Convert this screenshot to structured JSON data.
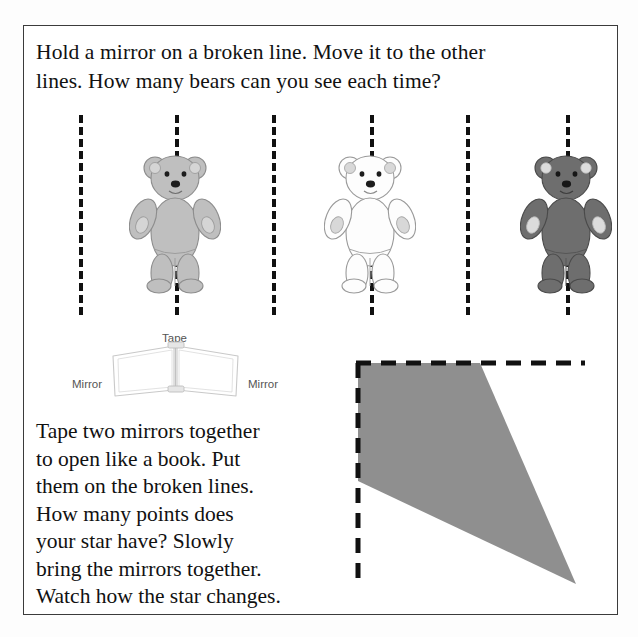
{
  "page": {
    "kind": "worksheet-page",
    "background_color": "#ffffff",
    "frame_color": "#3b3b3b"
  },
  "heading": {
    "lines": [
      "Hold a mirror on a broken line. Move it to the other",
      "lines. How many bears can you see each time?"
    ]
  },
  "bears_activity": {
    "broken_lines": [
      {
        "name": "broken-line-1",
        "x": 56
      },
      {
        "name": "broken-line-2",
        "x": 152
      },
      {
        "name": "broken-line-3",
        "x": 249
      },
      {
        "name": "broken-line-4",
        "x": 347
      },
      {
        "name": "broken-line-5",
        "x": 443
      },
      {
        "name": "broken-line-6",
        "x": 543
      }
    ],
    "line_style": "dashed",
    "line_color": "#111111",
    "bears": [
      {
        "name": "bear-gray",
        "center_x": 152,
        "body_color": "#bfbfbf",
        "outline_color": "#8d8d8d",
        "pad_color": "#d5d5d5",
        "label": "light gray bear"
      },
      {
        "name": "bear-white",
        "center_x": 347,
        "body_color": "#fdfdfd",
        "outline_color": "#9a9a9a",
        "pad_color": "#d8d8d8",
        "label": "white bear"
      },
      {
        "name": "bear-dark",
        "center_x": 543,
        "body_color": "#6e6e6e",
        "outline_color": "#4a4a4a",
        "pad_color": "#dcdcdc",
        "label": "dark gray bear"
      }
    ]
  },
  "mirror_diagram": {
    "tape_label": "Tape",
    "mirror_label_left": "Mirror",
    "mirror_label_right": "Mirror",
    "label_color": "#555555",
    "panel_outline_color": "#c9c9c9"
  },
  "body_text": {
    "lines": [
      "Tape two mirrors together",
      "to open like a book. Put",
      "them on the broken lines.",
      "How many points does",
      "your star have? Slowly",
      "bring the mirrors together.",
      "Watch how the star changes."
    ]
  },
  "star_figure": {
    "name": "quarter-star-wedge",
    "fill_color": "#8f8f8f",
    "guide_line_color": "#111111",
    "guide_line_style": "dashed",
    "vertical_guide": {
      "x": 28,
      "y_top": 18,
      "y_bottom": 240
    },
    "horizontal_guide": {
      "y": 18,
      "x_left": 28,
      "x_right": 255
    },
    "wedge_points": "28,18 150,18 246,239 28,136"
  }
}
